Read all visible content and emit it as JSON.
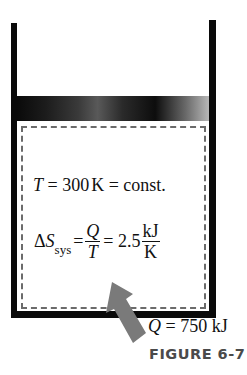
{
  "figure": {
    "caption": "FIGURE 6-7",
    "colors": {
      "walls": "#0a0a0a",
      "dashed_boundary": "#6b6b6b",
      "arrow": "#7a7a7a",
      "caption": "#4a4a4a"
    }
  },
  "system": {
    "temperature": {
      "symbol": "T",
      "equals1": " = 300",
      "unit": "K",
      "equals2": " = const."
    },
    "entropy": {
      "delta": "Δ",
      "symbol": "S",
      "subscript": "sys",
      "eq1": "=",
      "frac1_num": "Q",
      "frac1_den": "T",
      "eq2": "= 2.5",
      "frac2_num": "kJ",
      "frac2_den": "K"
    }
  },
  "heat_input": {
    "symbol": "Q",
    "value": " = 750 kJ"
  }
}
